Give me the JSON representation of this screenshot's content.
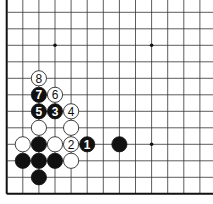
{
  "diagram": {
    "type": "go-board-fragment",
    "edges_shown": [
      "left",
      "bottom"
    ],
    "grid": {
      "x0": 6.7,
      "y0": 12.3,
      "spacing_x": 16.1,
      "spacing_y": 16.5,
      "cols": 13,
      "rows": 12
    },
    "star_points": [
      {
        "col": 3,
        "row": 2
      },
      {
        "col": 9,
        "row": 2
      },
      {
        "col": 9,
        "row": 8
      }
    ],
    "stones": [
      {
        "col": 2,
        "row": 4,
        "color": "white",
        "label": "8"
      },
      {
        "col": 2,
        "row": 5,
        "color": "black",
        "label": "7"
      },
      {
        "col": 3,
        "row": 5,
        "color": "white",
        "label": "6"
      },
      {
        "col": 2,
        "row": 6,
        "color": "black",
        "label": "5"
      },
      {
        "col": 3,
        "row": 6,
        "color": "black",
        "label": "3"
      },
      {
        "col": 4,
        "row": 6,
        "color": "white",
        "label": "4"
      },
      {
        "col": 2,
        "row": 7,
        "color": "white",
        "label": ""
      },
      {
        "col": 4,
        "row": 7,
        "color": "white",
        "label": ""
      },
      {
        "col": 1,
        "row": 8,
        "color": "white",
        "label": ""
      },
      {
        "col": 2,
        "row": 8,
        "color": "black",
        "label": ""
      },
      {
        "col": 3,
        "row": 8,
        "color": "white",
        "label": ""
      },
      {
        "col": 4,
        "row": 8,
        "color": "white",
        "label": "2"
      },
      {
        "col": 5,
        "row": 8,
        "color": "black",
        "label": "1"
      },
      {
        "col": 7,
        "row": 8,
        "color": "black",
        "label": ""
      },
      {
        "col": 1,
        "row": 9,
        "color": "black",
        "label": ""
      },
      {
        "col": 2,
        "row": 9,
        "color": "black",
        "label": ""
      },
      {
        "col": 3,
        "row": 9,
        "color": "black",
        "label": ""
      },
      {
        "col": 4,
        "row": 9,
        "color": "white",
        "label": ""
      },
      {
        "col": 2,
        "row": 10,
        "color": "black",
        "label": ""
      }
    ],
    "colors": {
      "line": "#333333",
      "edge": "#111111",
      "black": "#111111",
      "white": "#ffffff",
      "label_on_black": "#ffffff",
      "label_on_white": "#111111"
    }
  }
}
